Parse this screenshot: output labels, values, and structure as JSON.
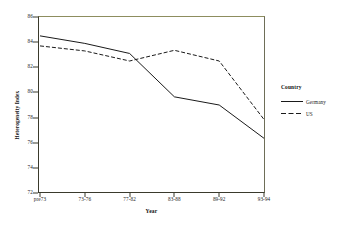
{
  "chart_data": {
    "type": "line",
    "title": "",
    "xlabel": "Year",
    "ylabel": "Heterogeneity Index",
    "categories": [
      "pre73",
      "73-76",
      "77-82",
      "83-88",
      "89-92",
      "93-94"
    ],
    "ylim": [
      72,
      86
    ],
    "yticks": [
      72,
      74,
      76,
      78,
      80,
      82,
      84,
      86
    ],
    "grid": false,
    "legend": {
      "title": "Country",
      "position": "right"
    },
    "series": [
      {
        "name": "Germany",
        "style": "solid",
        "color": "#1a1a1a",
        "values": [
          84.5,
          83.9,
          83.1,
          79.65,
          79.0,
          76.35
        ]
      },
      {
        "name": "US",
        "style": "dashed",
        "color": "#1a1a1a",
        "values": [
          83.7,
          83.3,
          82.5,
          83.35,
          82.5,
          77.85
        ]
      }
    ]
  },
  "axes": {
    "y_tick_labels": [
      "86",
      "84",
      "82",
      "80",
      "78",
      "76",
      "74",
      "72"
    ],
    "x_tick_labels": [
      "pre73",
      "73-76",
      "77-82",
      "83-88",
      "89-92",
      "93-94"
    ],
    "y_axis_title": "Heterogeneity Index",
    "x_axis_title": "Year"
  },
  "legend": {
    "title": "Country",
    "items": [
      {
        "label": "Germany",
        "style": "solid"
      },
      {
        "label": "US",
        "style": "dashed"
      }
    ]
  },
  "colors": {
    "line": "#1a1a1a",
    "frame": "#3a3a2c",
    "frame_top": "#8d8d5e",
    "background": "#ffffff"
  }
}
